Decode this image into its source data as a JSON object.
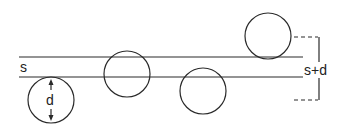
{
  "diagram": {
    "labels": {
      "gap_width": "s",
      "diameter": "d",
      "effective_width": "s+d"
    },
    "elements": {
      "parallel_lines": 2,
      "circles": [
        {
          "id": "below-gap-with-diameter",
          "relation": "tangent below lower line, annotated with d"
        },
        {
          "id": "straddling-upper-line",
          "relation": "crosses both lines within the gap"
        },
        {
          "id": "straddling-lower-line",
          "relation": "crosses lower line"
        },
        {
          "id": "above-gap",
          "relation": "tangent above upper line"
        }
      ],
      "bracket": "dashed extents with vertical bracket spanning s+d"
    },
    "colors": {
      "line": "#2a2a2a",
      "text": "#222222",
      "background": "#ffffff"
    }
  }
}
